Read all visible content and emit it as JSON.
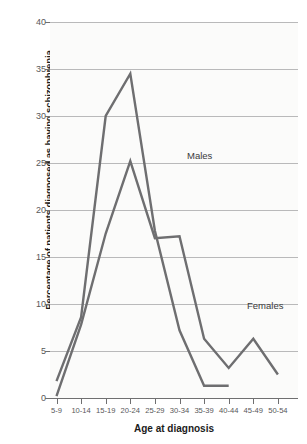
{
  "chart_data": {
    "type": "line",
    "title": "",
    "subtitle": "",
    "xlabel": "Age at diagnosis",
    "ylabel": "Percentage of patients diagnosed as having schizophrenia",
    "categories": [
      "5-9",
      "10-14",
      "15-19",
      "20-24",
      "25-29",
      "30-34",
      "35-39",
      "40-44",
      "45-49",
      "50-54"
    ],
    "ylim": [
      0,
      40
    ],
    "yticks": [
      0,
      5,
      10,
      15,
      20,
      25,
      30,
      35,
      40
    ],
    "ytick_labels": [
      "0",
      "5",
      "10",
      "15",
      "20",
      "25",
      "30",
      "35",
      "40"
    ],
    "grid": true,
    "legend_position": "inline-annotation",
    "series": [
      {
        "name": "Males",
        "color": "#6e6e70",
        "values": [
          1.8,
          8.6,
          30.0,
          34.5,
          17.8,
          7.2,
          1.3,
          1.3,
          null,
          null
        ]
      },
      {
        "name": "Females",
        "color": "#6e6e70",
        "values": [
          0.2,
          7.8,
          17.5,
          25.2,
          17.0,
          17.2,
          6.3,
          3.2,
          6.3,
          2.5
        ]
      }
    ],
    "annotations": [
      {
        "text": "Males",
        "x_category": "20-24",
        "value": 27.5
      },
      {
        "text": "Females",
        "x_category": "35-39",
        "value": 12.0
      }
    ],
    "colors": {
      "plot_background": "#fbfbfa",
      "page_background": "#ffffff",
      "gridline": "#b9b9ba",
      "axis": "#6f6f70",
      "tick_text": "#58585a",
      "title_text": "#1b1b1b",
      "series_line": "#6e6e70"
    }
  }
}
